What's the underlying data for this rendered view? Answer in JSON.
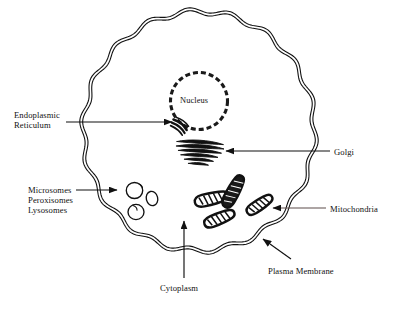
{
  "figure": {
    "background_color": "#ffffff",
    "ink_color": "#111111",
    "mitochondria_leader_color": "#5d4d4a"
  },
  "cell": {
    "shape": "scalloped-circle",
    "membrane_style": "double-line-wavy",
    "center_x": 199,
    "center_y": 131,
    "radius_x": 117,
    "radius_y": 121,
    "lobes": 18
  },
  "organelles": {
    "nucleus": {
      "label": "Nucleus",
      "style": "dashed-circle",
      "center_x": 199,
      "center_y": 101,
      "radius": 28
    },
    "endoplasmic_reticulum": {
      "name": "endoplasmic-reticulum",
      "style": "crescent-stack",
      "center_x": 180,
      "center_y": 126
    },
    "golgi": {
      "name": "golgi-apparatus",
      "style": "stacked-cisternae",
      "center_x": 201,
      "center_y": 152,
      "sacs": 6
    },
    "vesicles": {
      "name": "microsomes-peroxisomes-lysosomes",
      "style": "small-circles",
      "count": 3
    },
    "mitochondria": {
      "name": "mitochondria",
      "style": "bean-with-cristae",
      "count": 4
    }
  },
  "labels": [
    {
      "id": "endoplasmic-reticulum",
      "text": "Endoplasmic\nReticulum",
      "lines": [
        "Endoplasmic",
        "Reticulum"
      ],
      "x": 14,
      "y": 110,
      "align": "left"
    },
    {
      "id": "microsomes-peroxisomes-lysosomes",
      "text": "Microsomes\nPeroxisomes\nLysosomes",
      "lines": [
        "Microsomes",
        "Peroxisomes",
        "Lysosomes"
      ],
      "x": 28,
      "y": 185,
      "align": "left"
    },
    {
      "id": "nucleus",
      "text": "Nucleus",
      "x": 180,
      "y": 96,
      "align": "left"
    },
    {
      "id": "golgi",
      "text": "Golgi",
      "x": 334,
      "y": 147,
      "align": "left"
    },
    {
      "id": "mitochondria",
      "text": "Mitochondria",
      "x": 330,
      "y": 204,
      "align": "left"
    },
    {
      "id": "plasma-membrane",
      "text": "Plasma Membrane",
      "x": 268,
      "y": 266,
      "align": "left"
    },
    {
      "id": "cytoplasm",
      "text": "Cytoplasm",
      "x": 160,
      "y": 283,
      "align": "left"
    }
  ],
  "leaders": [
    {
      "id": "endoplasmic-reticulum-leader",
      "from_x": 66,
      "from_y": 122,
      "to_x": 172,
      "to_y": 122,
      "arrow": "end"
    },
    {
      "id": "microsomes-leader",
      "from_x": 76,
      "from_y": 190,
      "to_x": 117,
      "to_y": 190,
      "arrow": "end"
    },
    {
      "id": "golgi-leader",
      "from_x": 330,
      "from_y": 151,
      "to_x": 226,
      "to_y": 151,
      "arrow": "end"
    },
    {
      "id": "mitochondria-leader",
      "from_x": 326,
      "from_y": 208,
      "to_x": 273,
      "to_y": 208,
      "arrow": "end"
    },
    {
      "id": "plasma-membrane-leader",
      "from_x": 291,
      "from_y": 259,
      "to_x": 263,
      "to_y": 239,
      "arrow": "end"
    },
    {
      "id": "cytoplasm-leader",
      "from_x": 184,
      "from_y": 278,
      "to_x": 184,
      "to_y": 221,
      "arrow": "end"
    }
  ]
}
